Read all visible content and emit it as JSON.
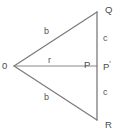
{
  "figure": {
    "type": "geometry-diagram",
    "background_color": "#ffffff",
    "stroke_color": "#7a7a7a",
    "label_color": "#555555",
    "width": 124,
    "height": 132,
    "vertices": [
      {
        "id": "O",
        "label": "0",
        "x": 14,
        "y": 66,
        "label_x": 2,
        "label_y": 61
      },
      {
        "id": "Q",
        "label": "Q",
        "x": 97,
        "y": 12,
        "label_x": 105,
        "label_y": 5
      },
      {
        "id": "R",
        "label": "R",
        "x": 97,
        "y": 120,
        "label_x": 105,
        "label_y": 120
      },
      {
        "id": "P",
        "label": "P",
        "x": 97,
        "y": 66,
        "label_x": 84,
        "label_y": 60
      },
      {
        "id": "Pprime",
        "label": "P",
        "prime": "′",
        "x": 97,
        "y": 66,
        "label_x": 103,
        "label_y": 59
      }
    ],
    "segments": [
      {
        "id": "OQ",
        "from": "O",
        "to": "Q",
        "label": "b",
        "label_x": 44,
        "label_y": 27
      },
      {
        "id": "OR",
        "from": "O",
        "to": "R",
        "label": "b",
        "label_x": 44,
        "label_y": 93
      },
      {
        "id": "OP",
        "from": "O",
        "to": "P",
        "label": "r",
        "label_x": 48,
        "label_y": 56
      },
      {
        "id": "QP",
        "from": "Q",
        "to": "P",
        "label": "c",
        "label_x": 103,
        "label_y": 34
      },
      {
        "id": "PR",
        "from": "P",
        "to": "R",
        "label": "c",
        "label_x": 103,
        "label_y": 88
      }
    ]
  }
}
